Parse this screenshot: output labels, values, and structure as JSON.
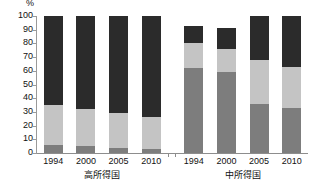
{
  "chart_data": {
    "type": "bar",
    "title": "",
    "subtitle": "",
    "xlabel": "",
    "ylabel": "%",
    "unit_label": "%",
    "stacked": true,
    "stacked_normalized": false,
    "orientation": "vertical",
    "grid": false,
    "legend": "none",
    "ylim": [
      0,
      100
    ],
    "yticks": [
      0,
      10,
      20,
      30,
      40,
      50,
      60,
      70,
      80,
      90,
      100
    ],
    "ytick_labels": [
      "0",
      "10",
      "20",
      "30",
      "40",
      "50",
      "60",
      "70",
      "80",
      "90",
      "100"
    ],
    "categories": [
      "1994",
      "2000",
      "2005",
      "2010",
      "1994",
      "2000",
      "2005",
      "2010"
    ],
    "groups": [
      {
        "caption": "高所得国",
        "categories": [
          "1994",
          "2000",
          "2005",
          "2010"
        ],
        "series": [
          {
            "name": "segment-bottom",
            "color": "#7d7d7d",
            "values": [
              6,
              5,
              4,
              3
            ]
          },
          {
            "name": "segment-middle",
            "color": "#c4c4c4",
            "values": [
              29,
              27,
              25,
              23
            ]
          },
          {
            "name": "segment-top",
            "color": "#2b2b2b",
            "values": [
              65,
              68,
              71,
              74
            ]
          }
        ],
        "totals": [
          100,
          100,
          100,
          100
        ]
      },
      {
        "caption": "中所得国",
        "categories": [
          "1994",
          "2000",
          "2005",
          "2010"
        ],
        "series": [
          {
            "name": "segment-bottom",
            "color": "#7d7d7d",
            "values": [
              62,
              59,
              36,
              33
            ]
          },
          {
            "name": "segment-middle",
            "color": "#c4c4c4",
            "values": [
              18,
              17,
              32,
              30
            ]
          },
          {
            "name": "segment-top",
            "color": "#2b2b2b",
            "values": [
              13,
              15,
              32,
              37
            ]
          }
        ],
        "totals": [
          93,
          91,
          100,
          100
        ]
      }
    ],
    "colors": {
      "segment_bottom": "#7d7d7d",
      "segment_middle": "#c4c4c4",
      "segment_top": "#2b2b2b",
      "axis": "#8d8d8d",
      "text": "#111111",
      "background": "#ffffff"
    }
  }
}
